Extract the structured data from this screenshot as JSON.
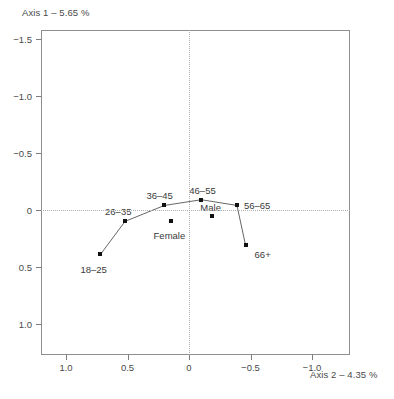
{
  "chart_data": {
    "type": "scatter",
    "title": "",
    "xlabel": "Axis 2 – 4.35 %",
    "ylabel": "Axis 1 – 5.65 %",
    "xlim": [
      1.25,
      -1.25
    ],
    "ylim": [
      1.25,
      -1.75
    ],
    "x_axis_reversed": true,
    "y_axis_reversed": true,
    "grid": false,
    "zero_reference_lines": true,
    "legend": "none",
    "xticks": [
      {
        "value": 1.0,
        "label": "1.0"
      },
      {
        "value": 0.5,
        "label": "0.5"
      },
      {
        "value": 0.0,
        "label": "0"
      },
      {
        "value": -0.5,
        "label": "−0.5"
      },
      {
        "value": -1.0,
        "label": "−1.0"
      }
    ],
    "yticks": [
      {
        "value": -1.5,
        "label": "−1.5"
      },
      {
        "value": -1.0,
        "label": "−1.0"
      },
      {
        "value": -0.5,
        "label": "−0.5"
      },
      {
        "value": 0.0,
        "label": "0"
      },
      {
        "value": 0.5,
        "label": "0.5"
      },
      {
        "value": 1.0,
        "label": "1.0"
      }
    ],
    "series": [
      {
        "name": "Age groups",
        "connected": true,
        "points": [
          {
            "label": "18–25",
            "x": 0.72,
            "y": 0.39,
            "label_dx": -20,
            "label_dy": 16
          },
          {
            "label": "26–35",
            "x": 0.52,
            "y": 0.1,
            "label_dx": -20,
            "label_dy": -9
          },
          {
            "label": "36–45",
            "x": 0.2,
            "y": -0.04,
            "label_dx": -18,
            "label_dy": -9
          },
          {
            "label": "46–55",
            "x": -0.1,
            "y": -0.09,
            "label_dx": -12,
            "label_dy": -9
          },
          {
            "label": "56–65",
            "x": -0.39,
            "y": -0.04,
            "label_dx": 7,
            "label_dy": 1
          },
          {
            "label": "66+",
            "x": -0.46,
            "y": 0.31,
            "label_dx": 9,
            "label_dy": 10
          }
        ]
      },
      {
        "name": "Gender",
        "connected": false,
        "points": [
          {
            "label": "Male",
            "x": -0.19,
            "y": 0.05,
            "label_dx": -12,
            "label_dy": -8
          },
          {
            "label": "Female",
            "x": 0.15,
            "y": 0.1,
            "label_dx": -17,
            "label_dy": 15
          }
        ]
      }
    ]
  },
  "axes": {
    "y_title": "Axis 1 – 5.65 %",
    "x_title": "Axis 2 – 4.35 %"
  },
  "colors": {
    "marker": "#111111",
    "frame": "#8e8e8e",
    "reference_line": "#b0b0b0",
    "text": "#3a3a3a",
    "background": "#ffffff"
  }
}
